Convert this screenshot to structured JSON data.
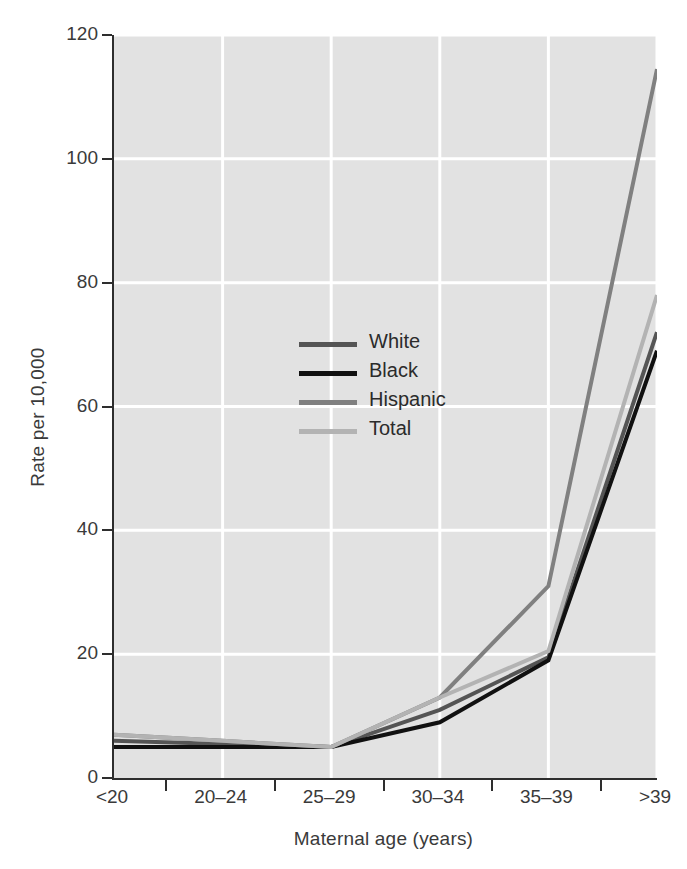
{
  "chart_data": {
    "type": "line",
    "title": "",
    "xlabel": "Maternal age (years)",
    "ylabel": "Rate per 10,000",
    "categories": [
      "<20",
      "20–24",
      "25–29",
      "30–34",
      "35–39",
      ">39"
    ],
    "ylim": [
      0,
      120
    ],
    "yticks": [
      0,
      20,
      40,
      60,
      80,
      100,
      120
    ],
    "ytick_labels": [
      "0",
      "20",
      "40",
      "60",
      "80",
      "100",
      "120"
    ],
    "grid": "horizontal-and-vertical white gridlines on light gray panel",
    "legend_position": "inside upper-left-center",
    "series": [
      {
        "name": "White",
        "color": "#555555",
        "values": [
          6,
          5.5,
          5,
          11,
          19.5,
          72
        ]
      },
      {
        "name": "Black",
        "color": "#111111",
        "values": [
          5,
          5,
          5,
          9,
          19,
          69
        ]
      },
      {
        "name": "Hispanic",
        "color": "#808080",
        "values": [
          7,
          6,
          5,
          13,
          31,
          114.5
        ]
      },
      {
        "name": "Total",
        "color": "#b3b3b3",
        "values": [
          7,
          6,
          5,
          13,
          20.5,
          78
        ]
      }
    ]
  },
  "style": {
    "panel_background": "#e2e2e2",
    "gridline_color": "#ffffff",
    "axis_color": "#2e2e2e",
    "text_color": "#3a3a3a",
    "page_background": "#ffffff"
  }
}
